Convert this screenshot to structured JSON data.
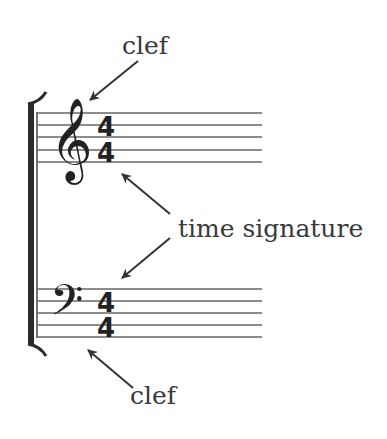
{
  "diagram": {
    "labels": {
      "top_clef": "clef",
      "time_signature": "time signature",
      "bottom_clef": "clef"
    },
    "staves": [
      {
        "clef": "treble-clef",
        "clef_glyph": "𝄞",
        "time_signature": {
          "numerator": "4",
          "denominator": "4"
        }
      },
      {
        "clef": "bass-clef",
        "clef_glyph": "𝄢",
        "time_signature": {
          "numerator": "4",
          "denominator": "4"
        }
      }
    ],
    "colors": {
      "lines": "#555555",
      "text": "#3a3a3a",
      "glyphs": "#222222",
      "background": "#ffffff"
    }
  }
}
